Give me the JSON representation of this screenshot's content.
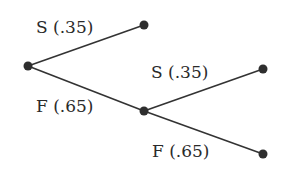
{
  "diagram": {
    "type": "probability-tree",
    "line_color": "#333333",
    "node_color": "#2e2e2e",
    "nodes": [
      {
        "id": "root",
        "x": 28,
        "y": 66
      },
      {
        "id": "s1",
        "x": 144,
        "y": 25
      },
      {
        "id": "f1",
        "x": 144,
        "y": 111
      },
      {
        "id": "s2",
        "x": 263,
        "y": 69
      },
      {
        "id": "f2",
        "x": 263,
        "y": 154
      }
    ],
    "edges": [
      {
        "from": "root",
        "to": "s1",
        "label": "S (.35)"
      },
      {
        "from": "root",
        "to": "f1",
        "label": "F (.65)"
      },
      {
        "from": "f1",
        "to": "s2",
        "label": "S (.35)"
      },
      {
        "from": "f1",
        "to": "f2",
        "label": "F (.65)"
      }
    ]
  }
}
